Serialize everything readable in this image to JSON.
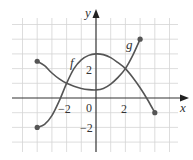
{
  "chart_data": {
    "type": "line",
    "title": "",
    "xlabel": "x",
    "ylabel": "y",
    "xlim": [
      -5.5,
      6
    ],
    "ylim": [
      -3.5,
      5.5
    ],
    "grid": true,
    "x_ticks": [
      {
        "value": -2,
        "label": "−2"
      },
      {
        "value": 0,
        "label": "0"
      },
      {
        "value": 2,
        "label": "2"
      }
    ],
    "y_ticks": [
      {
        "value": 2,
        "label": "2"
      },
      {
        "value": -2,
        "label": "−2"
      }
    ],
    "series": [
      {
        "name": "f",
        "label": "f",
        "points": [
          [
            -4,
            -2
          ],
          [
            -3.5,
            -1.8
          ],
          [
            -3,
            -1.2
          ],
          [
            -2.5,
            -0.2
          ],
          [
            -2,
            1
          ],
          [
            -1.5,
            2
          ],
          [
            -1,
            2.6
          ],
          [
            -0.5,
            2.9
          ],
          [
            0,
            3
          ],
          [
            0.5,
            2.95
          ],
          [
            1,
            2.75
          ],
          [
            1.5,
            2.4
          ],
          [
            2,
            2
          ],
          [
            2.5,
            1.4
          ],
          [
            3,
            0.7
          ],
          [
            3.5,
            -0.1
          ],
          [
            4,
            -1
          ]
        ],
        "endpoints": [
          [
            -4,
            -2
          ],
          [
            4,
            -1
          ]
        ]
      },
      {
        "name": "g",
        "label": "g",
        "points": [
          [
            -4,
            2.5
          ],
          [
            -3.5,
            2.2
          ],
          [
            -3,
            1.7
          ],
          [
            -2.5,
            1.3
          ],
          [
            -2,
            1
          ],
          [
            -1.5,
            0.8
          ],
          [
            -1,
            0.65
          ],
          [
            -0.5,
            0.57
          ],
          [
            0,
            0.55
          ],
          [
            0.5,
            0.65
          ],
          [
            1,
            0.95
          ],
          [
            1.5,
            1.4
          ],
          [
            2,
            2
          ],
          [
            2.5,
            2.9
          ],
          [
            3,
            4
          ]
        ],
        "endpoints": [
          [
            -4,
            2.5
          ],
          [
            3,
            4
          ]
        ]
      }
    ],
    "annotations": [
      {
        "text": "f",
        "x": -1.6,
        "y": 2.5
      },
      {
        "text": "g",
        "x": 2.2,
        "y": 3.4
      }
    ],
    "intersections": [
      [
        -2,
        1
      ],
      [
        2,
        2
      ]
    ]
  },
  "labels": {
    "x_axis": "x",
    "y_axis": "y",
    "f": "f",
    "g": "g",
    "tick_neg2_x": "−2",
    "tick_0": "0",
    "tick_2_x": "2",
    "tick_2_y": "2",
    "tick_neg2_y": "−2"
  },
  "colors": {
    "curve": "#555555",
    "axis": "#333333",
    "grid": "#d4d4d4"
  }
}
